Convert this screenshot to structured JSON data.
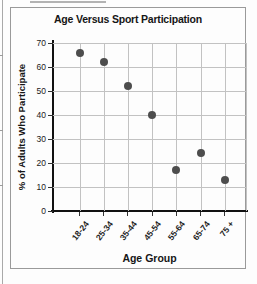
{
  "page": {
    "background": "#fdfdfd",
    "box_border_color": "#9a9a9a"
  },
  "chart_data": {
    "type": "scatter",
    "title": "Age Versus Sport Participation",
    "xlabel": "Age Group",
    "ylabel": "% of Adults Who Participate",
    "categories": [
      "18-24",
      "25-34",
      "35-44",
      "45-54",
      "55-64",
      "65-74",
      "75 +"
    ],
    "values": [
      66,
      62,
      52,
      40,
      17,
      24,
      13
    ],
    "y_ticks": [
      0,
      10,
      20,
      30,
      40,
      50,
      60,
      70
    ],
    "ylim": [
      0,
      70
    ],
    "grid": true,
    "legend": "none",
    "point_color": "#4d4d4d",
    "grid_color": "#c2c2c2",
    "axis_color": "#111111",
    "text_color": "#161616"
  }
}
